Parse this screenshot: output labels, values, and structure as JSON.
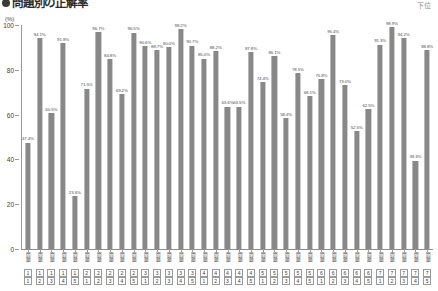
{
  "header": {
    "bullet_icon": "filled-circle-icon",
    "title": "問題別の正解率",
    "corner_note": "下位"
  },
  "axis": {
    "unit_label": "(%)",
    "y_ticks": [
      "100",
      "80",
      "60",
      "40",
      "20",
      "0"
    ],
    "x_group_prefix": "問題"
  },
  "chart_data": {
    "type": "bar",
    "title": "問題別の正解率",
    "xlabel": "問題",
    "ylabel": "(%)",
    "ylim": [
      0,
      100
    ],
    "ytick_step": 20,
    "grid": false,
    "legend": null,
    "bar_color": "#888888",
    "categories": [
      "1-1",
      "1-2",
      "1-3",
      "1-4",
      "1-5",
      "2-1",
      "2-2",
      "2-3",
      "2-4",
      "2-5",
      "3-1",
      "3-2",
      "3-3",
      "3-4",
      "3-5",
      "4-1",
      "4-2",
      "4-3",
      "4-4",
      "4-5",
      "5-1",
      "5-2",
      "5-3",
      "5-4",
      "5-5",
      "6-1",
      "6-2",
      "6-3",
      "6-4",
      "6-5",
      "7-1",
      "7-2",
      "7-3",
      "7-4",
      "7-5"
    ],
    "values": [
      47.4,
      94.1,
      60.5,
      91.8,
      23.6,
      71.5,
      96.7,
      84.8,
      69.2,
      96.5,
      90.6,
      88.7,
      90.0,
      98.2,
      90.7,
      85.0,
      88.2,
      63.6,
      63.5,
      87.8,
      74.4,
      86.1,
      58.4,
      78.5,
      68.1,
      75.8,
      95.4,
      73.0,
      52.5,
      62.5,
      91.3,
      98.9,
      94.2,
      39.3,
      88.8
    ],
    "labels": [
      "47.4%",
      "94.1%",
      "60.5%",
      "91.8%",
      "23.6%",
      "71.5%",
      "96.7%",
      "84.8%",
      "69.2%",
      "96.5%",
      "90.6%",
      "88.7%",
      "90.0%",
      "98.2%",
      "90.7%",
      "85.0%",
      "88.2%",
      "63.6%",
      "63.5%",
      "87.8%",
      "74.4%",
      "86.1%",
      "58.4%",
      "78.5%",
      "68.1%",
      "75.8%",
      "95.4%",
      "73.0%",
      "52.5%",
      "62.5%",
      "91.3%",
      "98.9%",
      "94.2%",
      "39.3%",
      "88.8%"
    ],
    "x_groups": [
      {
        "group": "1",
        "items": [
          "1",
          "2",
          "3",
          "4",
          "5"
        ]
      },
      {
        "group": "2",
        "items": [
          "1",
          "2",
          "3",
          "4",
          "5"
        ]
      },
      {
        "group": "3",
        "items": [
          "1",
          "2",
          "3",
          "4",
          "5"
        ]
      },
      {
        "group": "4",
        "items": [
          "1",
          "2",
          "3",
          "4",
          "5"
        ]
      },
      {
        "group": "5",
        "items": [
          "1",
          "2",
          "3",
          "4",
          "5"
        ]
      },
      {
        "group": "6",
        "items": [
          "1",
          "2",
          "3",
          "4",
          "5"
        ]
      },
      {
        "group": "7",
        "items": [
          "1",
          "2",
          "3",
          "4",
          "5"
        ]
      }
    ]
  }
}
